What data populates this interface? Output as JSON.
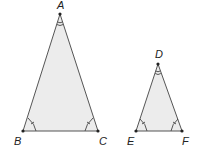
{
  "diagram": {
    "type": "similar-triangles",
    "fill_color": "#ececec",
    "stroke_color": "#555555",
    "triangles": [
      {
        "name": "ABC",
        "vertices": [
          {
            "label": "A",
            "x": 60,
            "y": 14,
            "label_x": 57,
            "label_y": 9
          },
          {
            "label": "B",
            "x": 23,
            "y": 131,
            "label_x": 14,
            "label_y": 145
          },
          {
            "label": "C",
            "x": 98,
            "y": 131,
            "label_x": 99,
            "label_y": 145
          }
        ],
        "angle_marks": {
          "A": 2,
          "B": 1,
          "C": 1
        }
      },
      {
        "name": "DEF",
        "vertices": [
          {
            "label": "D",
            "x": 158,
            "y": 64,
            "label_x": 155,
            "label_y": 58
          },
          {
            "label": "E",
            "x": 136,
            "y": 131,
            "label_x": 127,
            "label_y": 145
          },
          {
            "label": "F",
            "x": 182,
            "y": 131,
            "label_x": 182,
            "label_y": 145
          }
        ],
        "angle_marks": {
          "D": 2,
          "E": 1,
          "F": 1
        }
      }
    ]
  }
}
